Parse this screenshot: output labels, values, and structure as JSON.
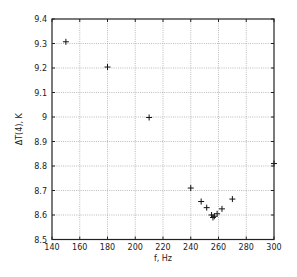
{
  "chart_data": {
    "type": "scatter",
    "title": "",
    "xlabel": "f, Hz",
    "ylabel": "ΔT(4), K",
    "xlim": [
      140,
      300
    ],
    "ylim": [
      8.5,
      9.4
    ],
    "xticks": [
      140,
      160,
      180,
      200,
      220,
      240,
      260,
      280,
      300
    ],
    "yticks": [
      8.5,
      8.6,
      8.7,
      8.8,
      8.9,
      9,
      9.1,
      9.2,
      9.3,
      9.4
    ],
    "xtick_labels": [
      "140",
      "160",
      "180",
      "200",
      "220",
      "240",
      "260",
      "280",
      "300"
    ],
    "ytick_labels": [
      "8.5",
      "8.6",
      "8.7",
      "8.8",
      "8.9",
      "9",
      "9.1",
      "9.2",
      "9.3",
      "9.4"
    ],
    "grid": true,
    "marker": "+",
    "legend": null,
    "series": [
      {
        "name": "dT(4)",
        "x": [
          150,
          180,
          210,
          240,
          247.5,
          251.5,
          255,
          256,
          257,
          259,
          262.5,
          270,
          300
        ],
        "y": [
          9.307,
          9.204,
          8.998,
          8.71,
          8.655,
          8.63,
          8.6,
          8.59,
          8.595,
          8.605,
          8.625,
          8.665,
          8.81
        ]
      }
    ]
  },
  "colors": {
    "axis": "#222222",
    "grid": "#aaaaaa",
    "marker": "#111111",
    "background": "#ffffff"
  }
}
